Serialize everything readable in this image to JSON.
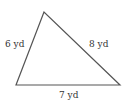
{
  "diagram": {
    "type": "triangle",
    "stroke_color": "#555555",
    "vertices": {
      "top": [
        44,
        12
      ],
      "bottom_left": [
        16,
        85
      ],
      "bottom_right": [
        120,
        85
      ]
    },
    "sides": {
      "left": {
        "label": "6 yd",
        "value": 6,
        "unit": "yd"
      },
      "right": {
        "label": "8 yd",
        "value": 8,
        "unit": "yd"
      },
      "bottom": {
        "label": "7 yd",
        "value": 7,
        "unit": "yd"
      }
    }
  }
}
